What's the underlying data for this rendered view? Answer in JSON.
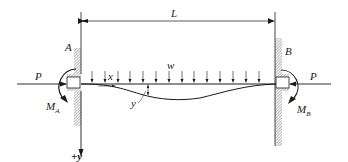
{
  "figure": {
    "type": "fixed-fixed beam with axial load and distributed load",
    "labels": {
      "span": "L",
      "support_left": "A",
      "support_right": "B",
      "axial_left": "P",
      "axial_right": "P",
      "moment_left": "M",
      "moment_left_sub": "A",
      "moment_right": "M",
      "moment_right_sub": "B",
      "distributed_load": "w",
      "x_coord": "x",
      "deflection": "y",
      "y_axis": "+y"
    },
    "load_arrow_count": 14,
    "colors": {
      "line": "#1a1a1a",
      "hatch": "#8a8a8a",
      "background": "#ffffff"
    }
  }
}
